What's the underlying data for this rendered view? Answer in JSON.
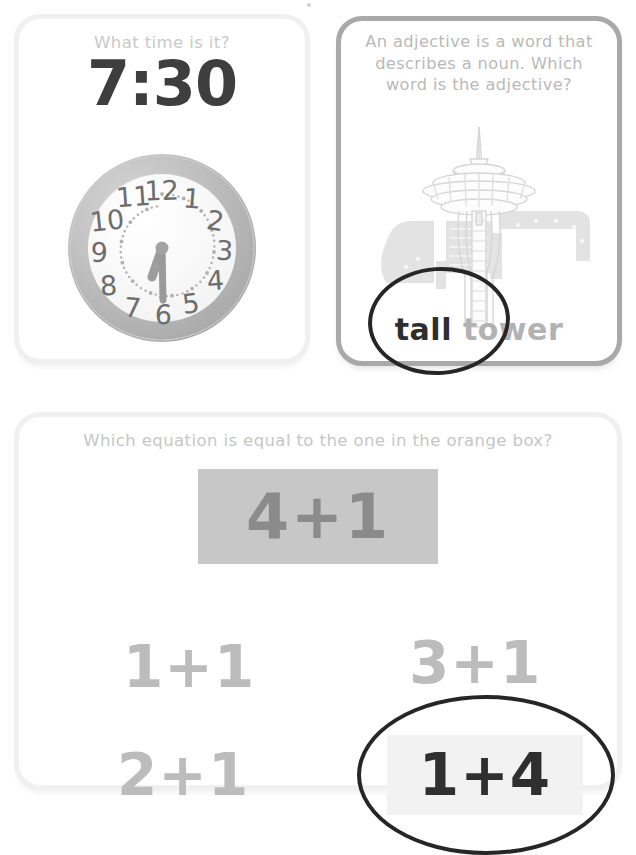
{
  "page": {
    "background_color": "#ffffff",
    "width": 636,
    "height": 813
  },
  "cards": [
    {
      "id": "clock-card",
      "prompt": "What time is it?",
      "digital_time": "7:30",
      "clock": {
        "hour_numerals": [
          "12",
          "1",
          "2",
          "3",
          "4",
          "5",
          "6",
          "7",
          "8",
          "9",
          "10",
          "11"
        ],
        "hour_hand_angle_deg": 225,
        "minute_hand_angle_deg": 180,
        "time_shown": "7:30",
        "bezel_color": "#b7b7b7",
        "face_color": "#fdfdfd",
        "numeral_color": "#6f6f6f",
        "hand_color": "#9a9a9a"
      }
    },
    {
      "id": "adjective-card",
      "prompt": "An adjective is a word that describes a noun. Which word is the adjective?",
      "illustration": "space-needle-tower",
      "answer_phrase": {
        "adjective": "tall",
        "noun": "tower"
      },
      "circled_word": "tall",
      "border_color": "#a9a9a9",
      "highlight_color": "#2e2e2e",
      "dim_color": "#b2b2b2"
    },
    {
      "id": "equations-card",
      "prompt": "Which equation is equal to the one in the orange box?",
      "target_equation": "4+1",
      "target_box_color": "#c7c7c7",
      "choices": [
        {
          "label": "1+1",
          "selected": false
        },
        {
          "label": "2+1",
          "selected": false
        },
        {
          "label": "3+1",
          "selected": false
        },
        {
          "label": "1+4",
          "selected": true
        }
      ],
      "circled_choice": "1+4",
      "circle_color": "#262626",
      "selected_box_color": "#f2f2f2"
    }
  ]
}
